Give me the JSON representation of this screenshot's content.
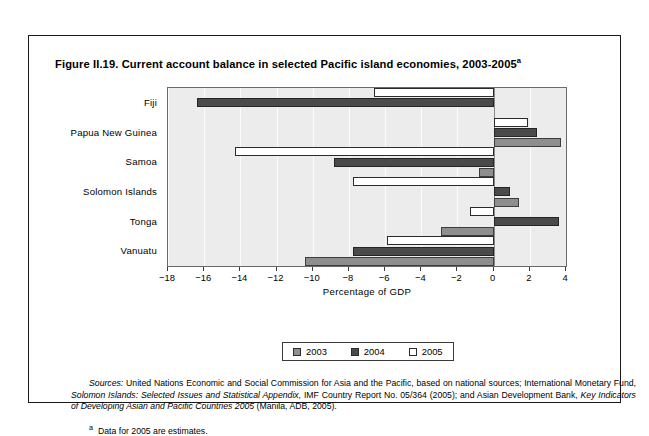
{
  "figure": {
    "title_main": "Figure II.19. Current account balance in selected Pacific island economies, 2003-2005",
    "title_footnote_mark": "a"
  },
  "legend": {
    "items": [
      {
        "label": "2003",
        "color": "#8e8e8e"
      },
      {
        "label": "2004",
        "color": "#4a4a4a"
      },
      {
        "label": "2005",
        "color": "#ffffff"
      }
    ]
  },
  "notes": {
    "sources_label": "Sources:",
    "sources_part1": " United Nations Economic and Social Commission for Asia and the Pacific, based on national sources; International Monetary Fund, ",
    "sources_italic1": "Solomon Islands: Selected Issues and Statistical Appendix,",
    "sources_part2": " IMF Country Report No. 05/364 (2005); and Asian Development Bank, ",
    "sources_italic2": "Key Indicators of Developing Asian and Pacific Countries 2005",
    "sources_part3": " (Manila, ADB, 2005).",
    "footnote_mark": "a",
    "footnote_text": "Data for 2005 are estimates."
  },
  "chart_data": {
    "type": "bar",
    "orientation": "horizontal",
    "title": "Figure II.19. Current account balance in selected Pacific island economies, 2003-2005",
    "xlabel": "Percentage of GDP",
    "ylabel": "",
    "xlim": [
      -18,
      4
    ],
    "xticks": [
      -18,
      -16,
      -14,
      -12,
      -10,
      -8,
      -6,
      -4,
      -2,
      0,
      2,
      4
    ],
    "xtick_labels": [
      "−18",
      "−16",
      "−14",
      "−12",
      "−10",
      "−8",
      "−6",
      "−4",
      "−2",
      "0",
      "2",
      "4"
    ],
    "grid": true,
    "legend_position": "bottom",
    "categories": [
      "Fiji",
      "Papua New Guinea",
      "Samoa",
      "Solomon Islands",
      "Tonga",
      "Vanuatu"
    ],
    "series": [
      {
        "name": "2003",
        "color": "#8e8e8e",
        "values": [
          null,
          3.7,
          -0.8,
          1.4,
          -2.9,
          -10.4
        ]
      },
      {
        "name": "2004",
        "color": "#4a4a4a",
        "values": [
          -16.4,
          2.4,
          -8.8,
          0.9,
          3.6,
          -7.8
        ]
      },
      {
        "name": "2005",
        "color": "#ffffff",
        "values": [
          -6.6,
          1.9,
          -14.3,
          -7.8,
          -1.3,
          -5.9
        ]
      }
    ]
  }
}
